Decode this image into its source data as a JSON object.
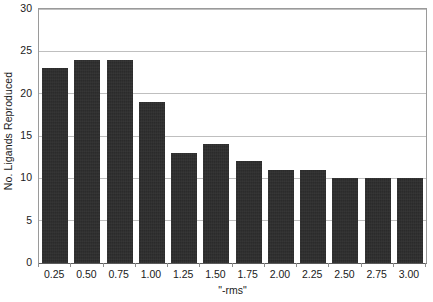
{
  "chart_data": {
    "type": "bar",
    "title": "",
    "xlabel": "\"-rms\"",
    "ylabel": "No. Ligands Reproduced",
    "categories": [
      "0.25",
      "0.50",
      "0.75",
      "1.00",
      "1.25",
      "1.50",
      "1.75",
      "2.00",
      "2.25",
      "2.50",
      "2.75",
      "3.00"
    ],
    "values": [
      23,
      24,
      24,
      19,
      13,
      14,
      12,
      11,
      11,
      10,
      10,
      10
    ],
    "ylim": [
      0,
      30
    ],
    "y_ticks": [
      "0",
      "5",
      "10",
      "15",
      "20",
      "25",
      "30"
    ],
    "y_tick_values": [
      0,
      5,
      10,
      15,
      20,
      25,
      30
    ],
    "grid": "horizontal",
    "legend": "none",
    "bar_color": "#2b2b2b",
    "grid_color": "#bfbfbf",
    "axis_color": "#8d8d8d",
    "background_color": "#ffffff"
  }
}
